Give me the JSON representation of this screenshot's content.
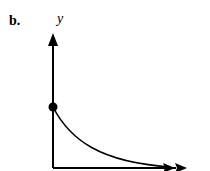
{
  "figure": {
    "panel_label": "b.",
    "y_axis_label": "y",
    "x_axis_label": ""
  },
  "diagram": {
    "type": "decay-curve",
    "elements": [
      "vertical y-axis with arrowhead",
      "horizontal x-axis with double arrowhead",
      "filled dot at y-intercept",
      "decreasing convex curve approaching x-axis"
    ],
    "colors": {
      "ink": "#000000",
      "background": "#ffffff"
    }
  }
}
